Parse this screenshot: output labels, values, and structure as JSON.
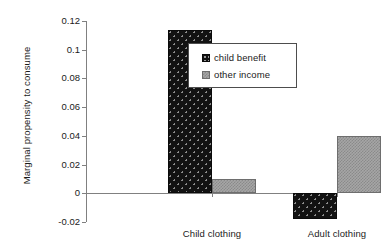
{
  "chart_data": {
    "type": "bar",
    "title": "",
    "xlabel": "",
    "ylabel": "Marginal propensity to consume",
    "categories": [
      "Child clothing",
      "Adult clothing"
    ],
    "series": [
      {
        "name": "child benefit",
        "values": [
          0.114,
          -0.018
        ],
        "color": "#121212",
        "pattern": "dark-dotted"
      },
      {
        "name": "other income",
        "values": [
          0.01,
          0.04
        ],
        "color": "#a6a6a6",
        "pattern": "gray-checkered"
      }
    ],
    "ylim": [
      -0.02,
      0.12
    ],
    "yticks": [
      0.12,
      0.1,
      0.08,
      0.06,
      0.04,
      0.02,
      0,
      -0.02
    ],
    "ytick_labels": [
      "0.12",
      "0.1",
      "0.08",
      "0.06",
      "0.04",
      "0.02",
      "0",
      "-0.02"
    ],
    "grid": false,
    "legend_position": "upper-center-right",
    "legend_entries": [
      "child benefit",
      "other income"
    ]
  }
}
